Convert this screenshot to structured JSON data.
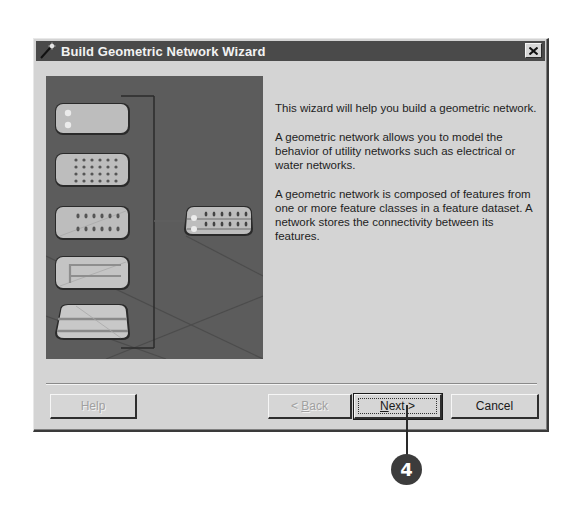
{
  "dialog": {
    "title": "Build Geometric Network Wizard",
    "close_icon": "close-icon",
    "title_icon": "wizard-wand-icon"
  },
  "illustration": {
    "description": "Feature classes combining into a geometric network",
    "input_feature_classes": [
      {
        "name": "junctions-few",
        "icon": "feature-class-junctions-icon"
      },
      {
        "name": "junctions-grid",
        "icon": "feature-class-dense-points-icon"
      },
      {
        "name": "junctions-rows",
        "icon": "feature-class-points-rows-icon"
      },
      {
        "name": "edges-lines",
        "icon": "feature-class-lines-icon"
      },
      {
        "name": "edges-bands",
        "icon": "feature-class-bands-icon"
      }
    ],
    "output": {
      "name": "geometric-network",
      "icon": "network-combined-icon"
    }
  },
  "content": {
    "paragraphs": [
      "This wizard will help you build a geometric network.",
      "A geometric network allows you to model the behavior of utility networks such as electrical or water networks.",
      "A geometric network is composed of features from one or more feature classes in a feature dataset. A network stores the connectivity between its features."
    ]
  },
  "buttons": {
    "help": {
      "label": "Help",
      "enabled": false
    },
    "back": {
      "label_prefix": "< ",
      "mnemonic": "B",
      "label_suffix": "ack",
      "enabled": false
    },
    "next": {
      "label_prefix": "",
      "mnemonic": "N",
      "label_suffix": "ext >",
      "enabled": true,
      "focused": true
    },
    "cancel": {
      "label": "Cancel",
      "enabled": true
    }
  },
  "callout": {
    "number": "4",
    "target": "next-button"
  },
  "colors": {
    "titlebar": "#4a4a4a",
    "dialog_bg": "#d4d4d4",
    "illustration_bg": "#5c5c5c",
    "callout_badge": "#3c3c3c"
  }
}
